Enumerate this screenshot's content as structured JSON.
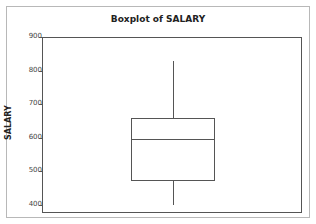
{
  "chart_data": {
    "type": "boxplot",
    "title": "Boxplot of SALARY",
    "xlabel": "",
    "ylabel": "SALARY",
    "ylim": [
      380,
      905
    ],
    "yticks": [
      400,
      500,
      600,
      700,
      800,
      900
    ],
    "grid": false,
    "series": [
      {
        "name": "SALARY",
        "whisker_low": 400,
        "q1": 470,
        "median": 597,
        "q3": 660,
        "whisker_high": 830
      }
    ]
  },
  "colors": {
    "line": "#555555",
    "frame": "#b8b8b8",
    "background": "#ffffff"
  }
}
